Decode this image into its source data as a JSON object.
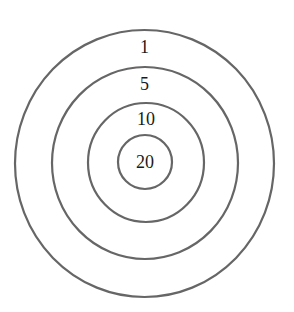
{
  "diagram": {
    "type": "concentric-target",
    "stroke_color": "#666666",
    "text_color": "#1a1a1a",
    "rings": [
      {
        "label": "1",
        "cx": 144.5,
        "cy": 163.5,
        "rx": 129.5,
        "ry": 133.5,
        "label_y": 47
      },
      {
        "label": "5",
        "cx": 145,
        "cy": 163,
        "rx": 93,
        "ry": 96,
        "label_y": 84
      },
      {
        "label": "10",
        "cx": 146,
        "cy": 162.5,
        "rx": 58,
        "ry": 59.5,
        "label_y": 119
      },
      {
        "label": "20",
        "cx": 145,
        "cy": 162,
        "rx": 27,
        "ry": 27,
        "label_y": 162
      }
    ]
  }
}
